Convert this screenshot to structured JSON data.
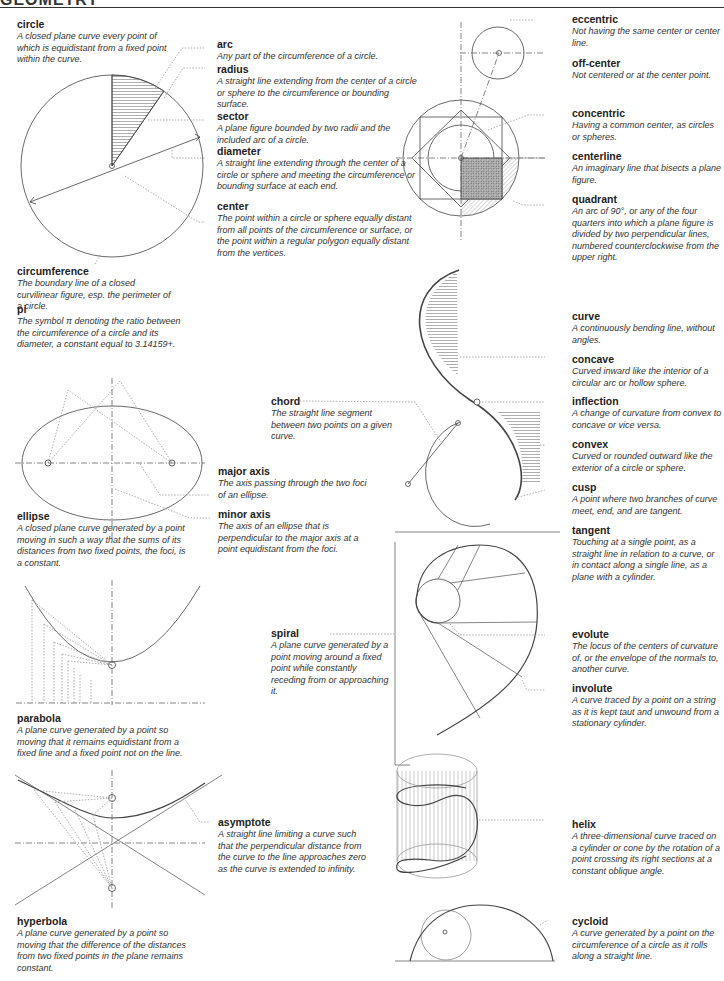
{
  "page": {
    "title": "GEOMETRY"
  },
  "terms": {
    "circle": {
      "term": "circle",
      "definition": "A closed plane curve every point of which is equidistant from a fixed point within the curve."
    },
    "arc": {
      "term": "arc",
      "definition": "Any part of the circumference of a circle."
    },
    "radius": {
      "term": "radius",
      "definition": "A straight line extending from the center of a circle or sphere to the circumference or bounding surface."
    },
    "sector": {
      "term": "sector",
      "definition": "A plane figure bounded by two radii and the included arc of a circle."
    },
    "diameter": {
      "term": "diameter",
      "definition": "A straight line extending through the center of a circle or sphere and meeting the circumference or bounding surface at each end."
    },
    "center": {
      "term": "center",
      "definition": "The point within a circle or sphere equally distant from all points of the circumference or surface, or the point within a regular polygon equally distant from the vertices."
    },
    "circumference": {
      "term": "circumference",
      "definition": "The boundary line of a closed curvilinear figure, esp. the perimeter of a circle."
    },
    "pi": {
      "term": "pi",
      "definition": "The symbol π denoting the ratio between the circumference of a circle and its diameter, a constant equal to 3.14159+."
    },
    "eccentric": {
      "term": "eccentric",
      "definition": "Not having the same center or center line."
    },
    "off_center": {
      "term": "off-center",
      "definition": "Not centered or at the center point."
    },
    "concentric": {
      "term": "concentric",
      "definition": "Having a common center, as circles or spheres."
    },
    "centerline": {
      "term": "centerline",
      "definition": "An imaginary line that bisects a plane figure."
    },
    "quadrant": {
      "term": "quadrant",
      "definition": "An arc of 90°, or any of the four quarters into which a plane figure is divided by two perpendicular lines, numbered counterclockwise from the upper right."
    },
    "curve": {
      "term": "curve",
      "definition": "A continuously bending line, without angles."
    },
    "concave": {
      "term": "concave",
      "definition": "Curved inward like the interior of a circular arc or hollow sphere."
    },
    "inflection": {
      "term": "inflection",
      "definition": "A change of curvature from convex to concave or vice versa."
    },
    "convex": {
      "term": "convex",
      "definition": "Curved or rounded outward like the exterior of a circle or sphere."
    },
    "cusp": {
      "term": "cusp",
      "definition": "A point where two branches of curve meet, end, and are tangent."
    },
    "tangent": {
      "term": "tangent",
      "definition": "Touching at a single point, as a straight line in relation to a curve, or in contact along a single line, as a plane with a cylinder."
    },
    "chord": {
      "term": "chord",
      "definition": "The straight line segment between two points on a given curve."
    },
    "major_axis": {
      "term": "major axis",
      "definition": "The axis passing through the two foci of an ellipse."
    },
    "minor_axis": {
      "term": "minor axis",
      "definition": "The axis of an ellipse that is perpendicular to the major axis at a point equidistant from the foci."
    },
    "ellipse": {
      "term": "ellipse",
      "definition": "A closed plane curve generated by a point moving in such a way that the sums of its distances from two fixed points, the foci, is a constant."
    },
    "spiral": {
      "term": "spiral",
      "definition": "A plane curve generated by a point moving around a fixed point while constantly receding from or approaching it."
    },
    "evolute": {
      "term": "evolute",
      "definition": "The locus of the centers of curvature of, or the envelope of the normals to, another curve."
    },
    "involute": {
      "term": "involute",
      "definition": "A curve traced by a point on a string as it is kept taut and unwound from a stationary cylinder."
    },
    "parabola": {
      "term": "parabola",
      "definition": "A plane curve generated by a point so moving that it remains equidistant from a fixed line and a fixed point not on the line."
    },
    "asymptote": {
      "term": "asymptote",
      "definition": "A straight line limiting a curve such that the perpendicular distance from the curve to the line approaches zero as the curve is extended to infinity."
    },
    "hyperbola": {
      "term": "hyperbola",
      "definition": "A plane curve generated by a point so moving that the difference of the distances from two fixed points in the plane remains constant."
    },
    "helix": {
      "term": "helix",
      "definition": "A three-dimensional curve traced on a cylinder or cone by the rotation of a point crossing its right sections at a constant oblique angle."
    },
    "cycloid": {
      "term": "cycloid",
      "definition": "A curve generated by a point on the circumference of a circle as it rolls along a straight line."
    }
  },
  "colors": {
    "ink": "#333333",
    "hatch": "#888888",
    "leader": "#999999"
  }
}
